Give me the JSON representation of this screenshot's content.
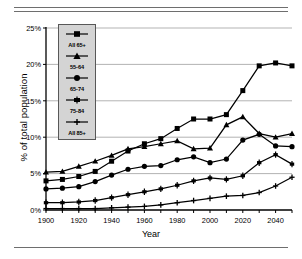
{
  "chart_data": {
    "type": "line",
    "title": "",
    "xlabel": "Year",
    "ylabel": "% of total population",
    "xlim": [
      1900,
      2050
    ],
    "ylim": [
      0,
      25
    ],
    "xticks": [
      1900,
      1920,
      1940,
      1960,
      1980,
      2000,
      2020,
      2040
    ],
    "yticks": [
      0,
      5,
      10,
      15,
      20,
      25
    ],
    "ytick_labels": [
      "0%",
      "5%",
      "10%",
      "15%",
      "20%",
      "25%"
    ],
    "grid": "horizontal",
    "legend_position": "upper-left-inside",
    "x": [
      1900,
      1910,
      1920,
      1930,
      1940,
      1950,
      1960,
      1970,
      1980,
      1990,
      2000,
      2010,
      2020,
      2030,
      2040,
      2050
    ],
    "series": [
      {
        "name": "All 65+",
        "marker": "square",
        "values": [
          4.0,
          4.2,
          4.6,
          5.3,
          6.7,
          8.1,
          9.1,
          9.8,
          11.2,
          12.5,
          12.5,
          13.1,
          16.4,
          19.8,
          20.2,
          19.8
        ]
      },
      {
        "name": "55-64",
        "marker": "triangle",
        "values": [
          5.2,
          5.3,
          6.0,
          6.7,
          7.5,
          8.4,
          8.7,
          9.1,
          9.5,
          8.4,
          8.5,
          11.7,
          12.8,
          10.5,
          10.0,
          10.5
        ]
      },
      {
        "name": "65-74",
        "marker": "circle",
        "values": [
          2.9,
          3.0,
          3.2,
          3.9,
          4.8,
          5.6,
          6.0,
          6.1,
          6.9,
          7.3,
          6.5,
          7.0,
          9.6,
          10.4,
          8.8,
          8.7
        ]
      },
      {
        "name": "75-84",
        "marker": "dash",
        "values": [
          1.0,
          1.0,
          1.1,
          1.3,
          1.7,
          2.1,
          2.5,
          2.9,
          3.4,
          4.0,
          4.4,
          4.2,
          4.7,
          6.5,
          7.6,
          6.3
        ]
      },
      {
        "name": "All 85+",
        "marker": "plus",
        "values": [
          0.2,
          0.2,
          0.2,
          0.2,
          0.3,
          0.4,
          0.5,
          0.7,
          1.0,
          1.3,
          1.6,
          1.9,
          2.0,
          2.4,
          3.3,
          4.5
        ]
      }
    ]
  },
  "axis": {
    "y_title": "% of total population",
    "x_title": "Year",
    "y_labels": [
      "25%",
      "20%",
      "15%",
      "10%",
      "5%",
      "0%"
    ],
    "x_labels": [
      "1900",
      "1920",
      "1940",
      "1960",
      "1980",
      "2000",
      "2020",
      "2040"
    ]
  },
  "legend": {
    "items": [
      {
        "label": "All 65+",
        "marker": "square"
      },
      {
        "label": "55-64",
        "marker": "triangle"
      },
      {
        "label": "65-74",
        "marker": "circle"
      },
      {
        "label": "75-84",
        "marker": "dash"
      },
      {
        "label": "All 85+",
        "marker": "plus"
      }
    ]
  },
  "colors": {
    "line": "#000000",
    "grid": "#aaaaaa",
    "axis": "#000000",
    "legend_bg": "#d4d4d4",
    "legend_border": "#585858",
    "rule": "#6e6e6e"
  }
}
